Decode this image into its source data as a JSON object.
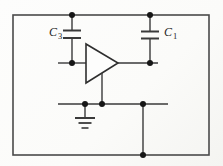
{
  "diagram": {
    "type": "circuit-schematic",
    "components": {
      "capacitor_left": {
        "label_base": "C",
        "label_sub": "3",
        "name": "capacitor-C3"
      },
      "capacitor_right": {
        "label_base": "C",
        "label_sub": "1",
        "name": "capacitor-C1"
      },
      "amplifier": {
        "name": "triangle-buffer-amplifier"
      },
      "ground": {
        "name": "earth-ground-symbol"
      }
    },
    "junction_count": 8,
    "colors": {
      "wire": "#3a3a3a",
      "enclosure": "#4a4a4a",
      "junction_dot": "#161616",
      "amplifier_fill": "#fdfdfc",
      "label": "#1f1f1f",
      "background": "#fbfbf9"
    }
  }
}
